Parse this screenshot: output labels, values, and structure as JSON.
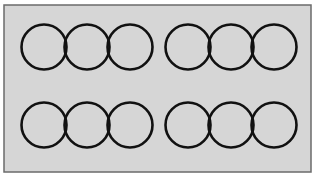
{
  "figure": {
    "canvas": {
      "width": 318,
      "height": 178,
      "background_color": "#ffffff"
    },
    "panel": {
      "x": 4,
      "y": 5,
      "width": 307,
      "height": 167,
      "fill_color": "#d6d6d6",
      "border_color": "#6b6b6b",
      "border_width": 1.5
    },
    "circle_style": {
      "stroke_color": "#111111",
      "stroke_width": 2.6,
      "fill": "none",
      "radius": 22.5
    },
    "groups": [
      {
        "name": "top-left-group",
        "row": "top",
        "column": "left",
        "center_y": 47,
        "circle_centers_x": [
          44,
          87,
          130
        ],
        "circle_count": 3
      },
      {
        "name": "top-right-group",
        "row": "top",
        "column": "right",
        "center_y": 47,
        "circle_centers_x": [
          188,
          231,
          274
        ],
        "circle_count": 3
      },
      {
        "name": "bottom-left-group",
        "row": "bottom",
        "column": "left",
        "center_y": 125,
        "circle_centers_x": [
          44,
          87,
          130
        ],
        "circle_count": 3
      },
      {
        "name": "bottom-right-group",
        "row": "bottom",
        "column": "right",
        "center_y": 125,
        "circle_centers_x": [
          188,
          231,
          274
        ],
        "circle_count": 3
      }
    ]
  },
  "chart_data": {
    "type": "scatter",
    "title": "",
    "xlabel": "",
    "ylabel": "",
    "grid": false,
    "legend": "none",
    "xlim": [
      0,
      318
    ],
    "ylim": [
      0,
      178
    ],
    "marker": "open-circle",
    "marker_radius": 22.5,
    "series": [
      {
        "name": "top-left-group",
        "x": [
          44,
          87,
          130
        ],
        "y": [
          47,
          47,
          47
        ],
        "values": [
          22.5,
          22.5,
          22.5
        ]
      },
      {
        "name": "top-right-group",
        "x": [
          188,
          231,
          274
        ],
        "y": [
          47,
          47,
          47
        ],
        "values": [
          22.5,
          22.5,
          22.5
        ]
      },
      {
        "name": "bottom-left-group",
        "x": [
          44,
          87,
          130
        ],
        "y": [
          125,
          125,
          125
        ],
        "values": [
          22.5,
          22.5,
          22.5
        ]
      },
      {
        "name": "bottom-right-group",
        "x": [
          188,
          231,
          274
        ],
        "y": [
          125,
          125,
          125
        ],
        "values": [
          22.5,
          22.5,
          22.5
        ]
      }
    ]
  }
}
